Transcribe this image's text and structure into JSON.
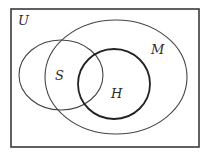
{
  "diagram": {
    "type": "venn",
    "universe": {
      "label": "U",
      "x": 11,
      "y": 9,
      "width": 188,
      "height": 138,
      "stroke": "#3a3a3a"
    },
    "sets": [
      {
        "id": "S",
        "label": "S",
        "cx": 61,
        "cy": 75,
        "rx": 42,
        "ry": 35,
        "stroke": "#444444",
        "stroke_width": 1.1
      },
      {
        "id": "M",
        "label": "M",
        "cx": 116,
        "cy": 77,
        "rx": 71,
        "ry": 57,
        "stroke": "#444444",
        "stroke_width": 1.1
      },
      {
        "id": "H",
        "label": "H",
        "cx": 114,
        "cy": 84,
        "rx": 36,
        "ry": 35,
        "stroke": "#222222",
        "stroke_width": 1.8
      }
    ],
    "labels": {
      "U": {
        "text": "U",
        "x": 18,
        "y": 25
      },
      "S": {
        "text": "S",
        "x": 55,
        "y": 80
      },
      "H": {
        "text": "H",
        "x": 111,
        "y": 98
      },
      "M": {
        "text": "M",
        "x": 151,
        "y": 54
      }
    }
  }
}
